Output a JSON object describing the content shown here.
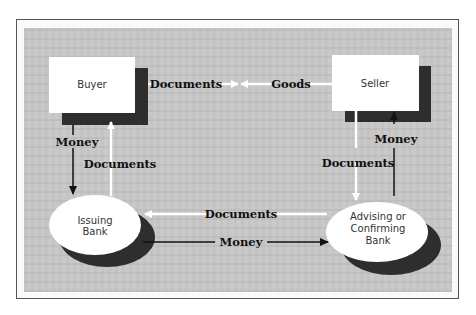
{
  "colors": {
    "panel_background": "#c9c9c9",
    "box_fill": "#ffffff",
    "shadow": "#2e2e2e",
    "white_arrow": "#ffffff",
    "black_arrow": "#111111",
    "frame_border": "#555555"
  },
  "nodes": {
    "buyer": {
      "label": "Buyer",
      "shape": "rectangle"
    },
    "seller": {
      "label": "Seller",
      "shape": "rectangle"
    },
    "issuing_bank": {
      "label_line1": "Issuing",
      "label_line2": "Bank",
      "shape": "ellipse"
    },
    "advising_bank": {
      "label_line1": "Advising or",
      "label_line2": "Confirming",
      "label_line3": "Bank",
      "shape": "ellipse"
    }
  },
  "edges": {
    "buyer_to_seller_documents": {
      "label": "Documents",
      "from": "Buyer",
      "to": "center",
      "color": "white"
    },
    "seller_to_buyer_goods": {
      "label": "Goods",
      "from": "Seller",
      "to": "center",
      "color": "white"
    },
    "buyer_to_issuing_money": {
      "label": "Money",
      "from": "Buyer",
      "to": "Issuing Bank",
      "color": "black"
    },
    "issuing_to_buyer_documents": {
      "label": "Documents",
      "from": "Issuing Bank",
      "to": "Buyer",
      "color": "white"
    },
    "seller_to_advising_documents": {
      "label": "Documents",
      "from": "Seller",
      "to": "Advising or Confirming Bank",
      "color": "white"
    },
    "advising_to_seller_money": {
      "label": "Money",
      "from": "Advising or Confirming Bank",
      "to": "Seller",
      "color": "black"
    },
    "advising_to_issuing_documents": {
      "label": "Documents",
      "from": "Advising or Confirming Bank",
      "to": "Issuing Bank",
      "color": "white"
    },
    "issuing_to_advising_money": {
      "label": "Money",
      "from": "Issuing Bank",
      "to": "Advising or Confirming Bank",
      "color": "black"
    }
  }
}
